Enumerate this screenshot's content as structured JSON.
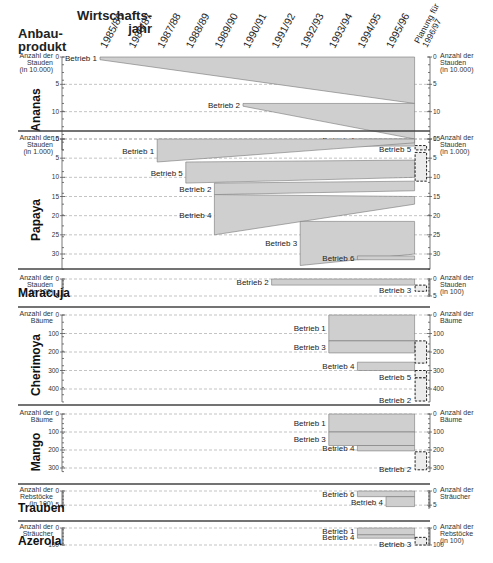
{
  "header": {
    "row_axis_title": "Anbau-\nprodukt",
    "row_axis_title_lines": [
      "Anbau-",
      "produkt"
    ],
    "col_axis_title_lines": [
      "Wirtschafts-",
      "jahr"
    ],
    "years": [
      "1985/86",
      "1986/87",
      "1987/88",
      "1988/89",
      "1989/90",
      "1990/91",
      "1991/92",
      "1992/93",
      "1993/94",
      "1994/95",
      "1995/96"
    ],
    "planning_label_lines": [
      "Planung für",
      "1996/97"
    ]
  },
  "chart_data": {
    "type": "gantt-area",
    "xlabel": "Wirtschaftsjahr",
    "ylabel": "Anbauprodukt",
    "x_categories": [
      "1985/86",
      "1986/87",
      "1987/88",
      "1988/89",
      "1989/90",
      "1990/91",
      "1991/92",
      "1992/93",
      "1993/94",
      "1994/95",
      "1995/96",
      "Planung für 1996/97"
    ],
    "panels": [
      {
        "product": "Ananas",
        "unit_left": [
          "Anzahl der",
          "Stauden",
          "(in 10.000)"
        ],
        "unit_right": [
          "Anzahl der",
          "Stauden",
          "(in 10.000)"
        ],
        "ylim": [
          0,
          17
        ],
        "ticks": [
          0,
          5,
          10,
          15
        ],
        "grid": [
          5,
          10,
          15
        ],
        "series": [
          {
            "name": "Betrieb 1",
            "start": "1985/86",
            "top": [
              0,
              0
            ],
            "bottom": [
              0.5,
              8.5
            ],
            "planning": null
          },
          {
            "name": "Betrieb 2",
            "start": "1990/91",
            "top": [
              8.5,
              8.5
            ],
            "bottom": [
              9,
              15
            ],
            "planning": null
          },
          {
            "name": "Betrieb 4",
            "start": "1994/95",
            "top": [
              15,
              15
            ],
            "bottom": [
              15.3,
              15.5
            ],
            "planning": null
          },
          {
            "name": "Betrieb 3",
            "start": "1994/95",
            "top": [
              15.5,
              15.5
            ],
            "bottom": [
              16.3,
              16.3
            ],
            "planning": null
          },
          {
            "name": "Betrieb 5",
            "start": "Planung für 1996/97",
            "top": [
              16.2,
              16.2
            ],
            "bottom": [
              17,
              17
            ],
            "planning": true
          }
        ]
      },
      {
        "product": "Papaya",
        "unit_left": [
          "Anzahl der",
          "Stauden",
          "(in 1.000)"
        ],
        "unit_right": [
          "Anzahl der",
          "Stauden",
          "(in 1.000)"
        ],
        "ylim": [
          0,
          34
        ],
        "ticks": [
          0,
          5,
          10,
          15,
          20,
          25,
          30
        ],
        "grid": [
          0,
          5,
          10,
          15,
          20,
          25,
          30
        ],
        "series": [
          {
            "name": "Betrieb 1",
            "start": "1987/88",
            "top": [
              0,
              0
            ],
            "bottom": [
              6,
              1
            ],
            "planning": null
          },
          {
            "name": "Betrieb 5",
            "start": "1988/89",
            "top": [
              6,
              5.5
            ],
            "bottom": [
              11.5,
              10
            ],
            "planning": null
          },
          {
            "name": "Betrieb 2",
            "start": "1989/90",
            "top": [
              11.5,
              11
            ],
            "bottom": [
              14.5,
              13.5
            ],
            "planning": null
          },
          {
            "name": "Betrieb 4",
            "start": "1989/90",
            "top": [
              14.5,
              15
            ],
            "bottom": [
              25,
              17
            ],
            "planning": null
          },
          {
            "name": "Betrieb 3",
            "start": "1992/93",
            "top": [
              21.5,
              21.5
            ],
            "bottom": [
              33,
              30
            ],
            "planning": null
          },
          {
            "name": "Betrieb 6",
            "start": "1994/95",
            "top": [
              30.5,
              30.5
            ],
            "bottom": [
              31.5,
              31.5
            ],
            "planning": null
          },
          {
            "name": "Planung",
            "start": "Planung für 1996/97",
            "top": [
              3.5,
              3.5
            ],
            "bottom": [
              11,
              11
            ],
            "planning": true
          }
        ]
      },
      {
        "product": "Maracuja",
        "unit_left": [
          "Anzahl der",
          "Stauden",
          "(in 100)"
        ],
        "unit_right": [
          "Anzahl der",
          "Stauden",
          "(in 100)"
        ],
        "ylim": [
          0,
          5
        ],
        "ticks": [
          0,
          5
        ],
        "grid": [
          0,
          5
        ],
        "series": [
          {
            "name": "Betrieb 2",
            "start": "1991/92",
            "top": [
              0,
              0
            ],
            "bottom": [
              1.8,
              1.8
            ],
            "planning": null
          },
          {
            "name": "Betrieb 3",
            "start": "Planung für 1996/97",
            "top": [
              1.8,
              1.8
            ],
            "bottom": [
              3.6,
              3.6
            ],
            "planning": true
          }
        ]
      },
      {
        "product": "Cherimoya",
        "unit_left": [
          "Anzahl der",
          "Bäume"
        ],
        "unit_right": [
          "Anzahl der",
          "Bäume"
        ],
        "ylim": [
          0,
          470
        ],
        "ticks": [
          0,
          100,
          200,
          300,
          400
        ],
        "grid": [
          0,
          100,
          200,
          300,
          400
        ],
        "series": [
          {
            "name": "Betrieb 1",
            "start": "1993/94",
            "top": [
              0,
              0
            ],
            "bottom": [
              140,
              140
            ],
            "planning": null
          },
          {
            "name": "Betrieb 3",
            "start": "1993/94",
            "top": [
              140,
              140
            ],
            "bottom": [
              205,
              205
            ],
            "planning": null
          },
          {
            "name": "Betrieb 4",
            "start": "1994/95",
            "top": [
              255,
              255
            ],
            "bottom": [
              300,
              300
            ],
            "planning": null
          },
          {
            "name": "Betrieb 3 (Planung)",
            "start": "Planung für 1996/97",
            "top": [
              140,
              140
            ],
            "bottom": [
              260,
              260
            ],
            "planning": true
          },
          {
            "name": "Betrieb 5",
            "start": "Planung für 1996/97",
            "top": [
              300,
              300
            ],
            "bottom": [
              340,
              340
            ],
            "planning": true
          },
          {
            "name": "Betrieb 2",
            "start": "Planung für 1996/97",
            "top": [
              340,
              340
            ],
            "bottom": [
              465,
              465
            ],
            "planning": true
          }
        ]
      },
      {
        "product": "Mango",
        "unit_left": [
          "Anzahl der",
          "Bäume"
        ],
        "unit_right": [
          "Anzahl der",
          "Bäume"
        ],
        "ylim": [
          0,
          320
        ],
        "ticks": [
          0,
          100,
          200,
          300
        ],
        "grid": [
          0,
          100,
          200,
          300
        ],
        "series": [
          {
            "name": "Betrieb 1",
            "start": "1993/94",
            "top": [
              0,
              0
            ],
            "bottom": [
              100,
              100
            ],
            "planning": null
          },
          {
            "name": "Betrieb 3",
            "start": "1993/94",
            "top": [
              100,
              100
            ],
            "bottom": [
              175,
              175
            ],
            "planning": null
          },
          {
            "name": "Betrieb 4",
            "start": "1994/95",
            "top": [
              175,
              175
            ],
            "bottom": [
              205,
              205
            ],
            "planning": null
          },
          {
            "name": "Betrieb 2",
            "start": "Planung für 1996/97",
            "top": [
              210,
              210
            ],
            "bottom": [
              310,
              310
            ],
            "planning": true
          }
        ]
      },
      {
        "product": "Trauben",
        "unit_left": [
          "Anzahl der",
          "Rebstöcke",
          "(in 100)"
        ],
        "unit_right": [
          "Anzahl der",
          "Sträucher"
        ],
        "ylim": [
          0,
          6
        ],
        "ticks": [
          0,
          5
        ],
        "grid": [
          0,
          5
        ],
        "series": [
          {
            "name": "Betrieb 6",
            "start": "1994/95",
            "top": [
              0,
              0
            ],
            "bottom": [
              2,
              2
            ],
            "planning": null
          },
          {
            "name": "Betrieb 4",
            "start": "1995/96",
            "top": [
              2,
              2
            ],
            "bottom": [
              5.5,
              5.5
            ],
            "planning": null
          }
        ]
      },
      {
        "product": "Azerola",
        "unit_left": [
          "Anzahl der",
          "Sträucher"
        ],
        "unit_right": [
          "Anzahl der",
          "Rebstöcke",
          "(in 100)"
        ],
        "ylim": [
          0,
          100
        ],
        "ticks": [
          0,
          100
        ],
        "grid": [
          0,
          100
        ],
        "series": [
          {
            "name": "Betrieb 1",
            "start": "1994/95",
            "top": [
              0,
              0
            ],
            "bottom": [
              40,
              40
            ],
            "planning": null
          },
          {
            "name": "Betrieb 4",
            "start": "1994/95",
            "top": [
              40,
              40
            ],
            "bottom": [
              60,
              60
            ],
            "planning": null
          },
          {
            "name": "Betrieb 3",
            "start": "Planung für 1996/97",
            "top": [
              55,
              55
            ],
            "bottom": [
              100,
              100
            ],
            "planning": true
          }
        ]
      }
    ]
  }
}
